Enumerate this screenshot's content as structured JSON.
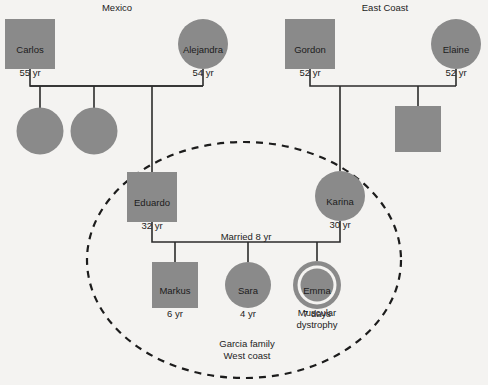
{
  "diagram": {
    "type": "genogram",
    "title_labels": [
      {
        "name": "region-label-mexico",
        "text": "Mexico",
        "x": 117,
        "y": 3
      },
      {
        "name": "region-label-east-coast",
        "text": "East Coast",
        "x": 385,
        "y": 3
      }
    ],
    "colors": {
      "background": "#f4f3f1",
      "node_fill": "#8a8a8a",
      "node_stroke": "#8a8a8a",
      "line": "#2b2b2b",
      "text": "#1c1c1c",
      "inner_ring_gap": "#f4f3f1"
    },
    "people": [
      {
        "id": "carlos",
        "name": "Carlos",
        "age": "55 yr",
        "shape": "square",
        "cx": 30,
        "cy": 44,
        "size": 50,
        "labeled": true,
        "generation": 1,
        "family": "mexico"
      },
      {
        "id": "alejandra",
        "name": "Alejandra",
        "age": "54 yr",
        "shape": "circle",
        "cx": 203,
        "cy": 44,
        "size": 50,
        "labeled": true,
        "generation": 1,
        "family": "mexico"
      },
      {
        "id": "gordon",
        "name": "Gordon",
        "age": "52 yr",
        "shape": "square",
        "cx": 310,
        "cy": 44,
        "size": 50,
        "labeled": true,
        "generation": 1,
        "family": "east-coast"
      },
      {
        "id": "elaine",
        "name": "Elaine",
        "age": "52 yr",
        "shape": "circle",
        "cx": 456,
        "cy": 44,
        "size": 50,
        "labeled": true,
        "generation": 1,
        "family": "east-coast"
      },
      {
        "id": "sibling-mexico-1",
        "name": "",
        "age": "",
        "shape": "circle",
        "cx": 40,
        "cy": 131,
        "size": 47,
        "labeled": false,
        "generation": 2,
        "family": "mexico"
      },
      {
        "id": "sibling-mexico-2",
        "name": "",
        "age": "",
        "shape": "circle",
        "cx": 94,
        "cy": 131,
        "size": 47,
        "labeled": false,
        "generation": 2,
        "family": "mexico"
      },
      {
        "id": "sibling-east-coast-1",
        "name": "",
        "age": "",
        "shape": "square",
        "cx": 418,
        "cy": 129,
        "size": 46,
        "labeled": false,
        "generation": 2,
        "family": "east-coast"
      },
      {
        "id": "eduardo",
        "name": "Eduardo",
        "age": "32 yr",
        "shape": "square",
        "cx": 152,
        "cy": 197,
        "size": 50,
        "labeled": true,
        "generation": 2,
        "family": "mexico"
      },
      {
        "id": "karina",
        "name": "Karina",
        "age": "30 yr",
        "shape": "circle",
        "cx": 340,
        "cy": 196,
        "size": 50,
        "labeled": true,
        "generation": 2,
        "family": "east-coast"
      },
      {
        "id": "markus",
        "name": "Markus",
        "age": "6 yr",
        "shape": "square",
        "cx": 175,
        "cy": 285,
        "size": 46,
        "labeled": true,
        "generation": 3,
        "family": "garcia"
      },
      {
        "id": "sara",
        "name": "Sara",
        "age": "4 yr",
        "shape": "circle",
        "cx": 248,
        "cy": 285,
        "size": 46,
        "labeled": true,
        "generation": 3,
        "family": "garcia"
      },
      {
        "id": "emma",
        "name": "Emma",
        "age": "7 days",
        "shape": "double-circle",
        "cx": 317,
        "cy": 285,
        "size": 48,
        "labeled": true,
        "generation": 3,
        "family": "garcia",
        "condition": "Muscular\ndystrophy"
      }
    ],
    "annotations": [
      {
        "name": "marriage-duration-label",
        "text": "Married 8 yr",
        "x": 246,
        "y": 236
      },
      {
        "name": "household-label",
        "text": "Garcia family\nWest coast",
        "x": 247,
        "y": 344
      },
      {
        "name": "emma-condition-label",
        "text": "Muscular\ndystrophy",
        "x": 317,
        "y": 313
      }
    ],
    "household_circle": {
      "name": "garcia-household-boundary",
      "cx": 244,
      "cy": 260,
      "rx": 157,
      "ry": 118,
      "style": "dashed"
    },
    "connections": [
      {
        "name": "union-carlos-alejandra",
        "type": "union"
      },
      {
        "name": "union-gordon-elaine",
        "type": "union"
      },
      {
        "name": "union-eduardo-karina",
        "type": "union"
      }
    ]
  }
}
